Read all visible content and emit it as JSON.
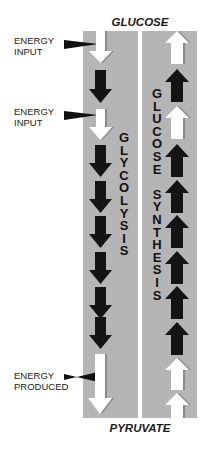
{
  "top_label": "GLUCOSE",
  "bottom_label": "PYRUVATE",
  "colors": {
    "panel": "#b5b5b5",
    "arrow_dark": "#141414",
    "arrow_light": "#ffffff",
    "text": "#1a1a1a"
  },
  "side_labels": [
    {
      "line1": "ENERGY",
      "line2": "INPUT"
    },
    {
      "line1": "ENERGY",
      "line2": "INPUT"
    },
    {
      "line1": "ENERGY",
      "line2": "PRODUCED"
    }
  ],
  "left_column": {
    "name": "GLYCOLYSIS",
    "direction": "down",
    "arrows": [
      "white",
      "black",
      "white",
      "black",
      "black",
      "black",
      "black",
      "black",
      "black",
      "white-long"
    ]
  },
  "right_column": {
    "name": "GLUCOSE SYNTHESIS",
    "direction": "up",
    "arrows": [
      "white",
      "black",
      "white",
      "black",
      "black",
      "black",
      "black",
      "black",
      "black",
      "white",
      "white"
    ]
  }
}
